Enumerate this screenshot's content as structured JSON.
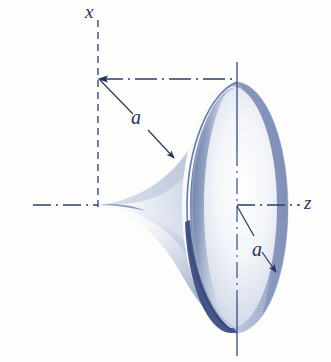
{
  "figure": {
    "background_color": "#fdfdfc",
    "ink_color": "#27355e",
    "shade_color": "#8d9ec4",
    "dark_shade_color": "#3d4f80"
  },
  "axes": {
    "vertical": {
      "name": "x-axis",
      "label": "x",
      "style": "dashed",
      "x_px": 98,
      "y_top_px": 20,
      "y_bottom_px": 207
    },
    "horizontal": {
      "name": "z-axis",
      "label": "z",
      "style": "dash-dot",
      "y_px": 205,
      "x_left_px": 33,
      "x_right_px": 300
    },
    "rim_axis": {
      "name": "rim-center-line",
      "label": "",
      "style": "solid-and-dash-dot",
      "x_px": 237,
      "y_top_px": 62,
      "y_bottom_px": 356
    },
    "top_tie": {
      "name": "top-dimension-line",
      "style": "dash-dot",
      "y_px": 79,
      "x_left_px": 98,
      "x_right_px": 237
    }
  },
  "dimensions": [
    {
      "id": "a-upper",
      "label": "a",
      "description": "distance from x-axis top corner to horn surface",
      "from_px": [
        99,
        80
      ],
      "to_px": [
        176,
        161
      ],
      "label_px": [
        131,
        107
      ]
    },
    {
      "id": "a-lower",
      "label": "a",
      "description": "radius of the horn rim from the z-axis",
      "from_px": [
        237,
        205
      ],
      "to_px": [
        276,
        272
      ],
      "label_px": [
        252,
        239
      ]
    }
  ],
  "surface": {
    "name": "pseudosphere-horn",
    "rim_center_px": [
      237,
      205
    ],
    "rim_semi_major_px": 128,
    "rim_semi_minor_px": 48,
    "tip_px": [
      99,
      205
    ],
    "description": "Funnel / horn of revolution flaring from a point on the z-axis to an elliptical rim"
  }
}
